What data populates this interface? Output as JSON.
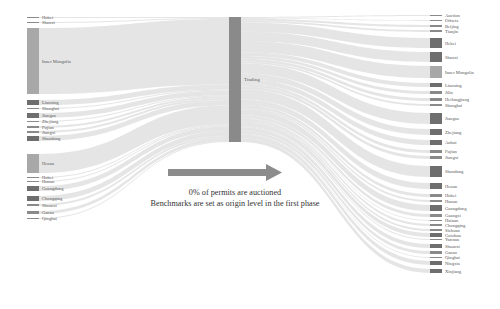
{
  "diagram": {
    "type": "sankey",
    "middle_node": {
      "label": "Trading",
      "x": 229,
      "y0": 17,
      "y1": 142
    },
    "left_nodes": [
      {
        "label": "Hubei",
        "y": 17,
        "h": 1
      },
      {
        "label": "Shanxi",
        "y": 22,
        "h": 1
      },
      {
        "label": "Inner Mongolia",
        "y": 28,
        "h": 66
      },
      {
        "label": "Liaoning",
        "y": 100,
        "h": 5
      },
      {
        "label": "Shanghai",
        "y": 108,
        "h": 1
      },
      {
        "label": "Jiangsu",
        "y": 113,
        "h": 5
      },
      {
        "label": "Zhejiang",
        "y": 121,
        "h": 1
      },
      {
        "label": "Fujian",
        "y": 126,
        "h": 2
      },
      {
        "label": "Jiangxi",
        "y": 131,
        "h": 2
      },
      {
        "label": "Shandong",
        "y": 136,
        "h": 5
      },
      {
        "label": "Henan",
        "y": 154,
        "h": 19
      },
      {
        "label": "Hubei",
        "y": 177,
        "h": 1
      },
      {
        "label": "Hunan",
        "y": 181,
        "h": 1
      },
      {
        "label": "Guangdong",
        "y": 186,
        "h": 5
      },
      {
        "label": "Chongqing",
        "y": 196,
        "h": 5
      },
      {
        "label": "Shaanxi",
        "y": 204,
        "h": 2
      },
      {
        "label": "Gansu",
        "y": 211,
        "h": 3
      },
      {
        "label": "Qinghai",
        "y": 218,
        "h": 1
      }
    ],
    "right_nodes": [
      {
        "label": "Auction",
        "y": 15,
        "h": 1
      },
      {
        "label": "Offsets",
        "y": 20,
        "h": 1
      },
      {
        "label": "Beijing",
        "y": 25,
        "h": 2
      },
      {
        "label": "Tianjin",
        "y": 30,
        "h": 2
      },
      {
        "label": "Hebei",
        "y": 38,
        "h": 10
      },
      {
        "label": "Shanxi",
        "y": 52,
        "h": 10
      },
      {
        "label": "Inner Mongolia",
        "y": 66,
        "h": 12
      },
      {
        "label": "Liaoning",
        "y": 83,
        "h": 4
      },
      {
        "label": "Jilin",
        "y": 91,
        "h": 3
      },
      {
        "label": "Heilongjiang",
        "y": 98,
        "h": 3
      },
      {
        "label": "Shanghai",
        "y": 104,
        "h": 2
      },
      {
        "label": "Jiangsu",
        "y": 113,
        "h": 11
      },
      {
        "label": "Zhejiang",
        "y": 129,
        "h": 6
      },
      {
        "label": "Anhui",
        "y": 140,
        "h": 5
      },
      {
        "label": "Fujian",
        "y": 150,
        "h": 3
      },
      {
        "label": "Jiangxi",
        "y": 156,
        "h": 3
      },
      {
        "label": "Shandong",
        "y": 166,
        "h": 11
      },
      {
        "label": "Henan",
        "y": 183,
        "h": 6
      },
      {
        "label": "Hubei",
        "y": 194,
        "h": 3
      },
      {
        "label": "Hunan",
        "y": 200,
        "h": 2
      },
      {
        "label": "Guangdong",
        "y": 205,
        "h": 6
      },
      {
        "label": "Guangxi",
        "y": 214,
        "h": 3
      },
      {
        "label": "Hainan",
        "y": 220,
        "h": 1
      },
      {
        "label": "Chongqing",
        "y": 224,
        "h": 2
      },
      {
        "label": "Sichuan",
        "y": 229,
        "h": 2
      },
      {
        "label": "Guizhou",
        "y": 233,
        "h": 4
      },
      {
        "label": "Yunnan",
        "y": 239,
        "h": 1
      },
      {
        "label": "Shaanxi",
        "y": 244,
        "h": 4
      },
      {
        "label": "Gansu",
        "y": 251,
        "h": 3
      },
      {
        "label": "Qinghai",
        "y": 257,
        "h": 1
      },
      {
        "label": "Ningxia",
        "y": 261,
        "h": 4
      },
      {
        "label": "Xinjiang",
        "y": 269,
        "h": 4
      }
    ],
    "arrow_label": "",
    "caption_line1": "0% of permits are auctioned",
    "caption_line2": "Benchmarks are set as origin level in the first phase",
    "colors": {
      "node_dark": "#6e6e6e",
      "node_mid": "#8a8a8a",
      "node_light": "#a8a8a8",
      "flow": "#dcdcdc",
      "arrow": "#8c8c8c"
    }
  }
}
